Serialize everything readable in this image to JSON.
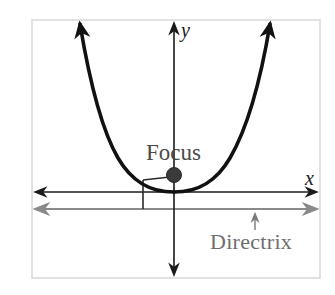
{
  "diagram": {
    "labels": {
      "x_axis": "x",
      "y_axis": "y",
      "focus": "Focus",
      "directrix": "Directrix"
    },
    "colors": {
      "frame": "#d9d9d9",
      "axes": "#1a1a1a",
      "parabola": "#111111",
      "focus_point": "#3a3a3a",
      "directrix_line": "#8a8a8a",
      "focus_text": "#4a4a4a",
      "directrix_text": "#6e6e6e"
    },
    "elements": {
      "parabola": {
        "opens": "up",
        "vertex": "origin"
      },
      "focus_point": {
        "position": "on y-axis above vertex"
      },
      "directrix": {
        "orientation": "horizontal",
        "position": "below x-axis"
      },
      "equal_distance_marker": "segment from a point on the parabola to the focus and perpendicular to the directrix"
    }
  }
}
